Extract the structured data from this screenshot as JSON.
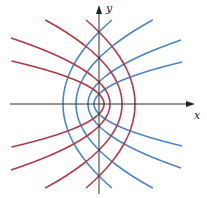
{
  "diagram": {
    "title": "",
    "axes": {
      "x_label": "x",
      "y_label": "y",
      "origin_px": [
        99,
        104
      ],
      "x_range_px": [
        10,
        195
      ],
      "y_range_px": [
        5,
        194
      ],
      "color": "#333333"
    },
    "clip": {
      "x_min": -89,
      "x_max": 85,
      "y_max": 84
    },
    "families": [
      {
        "name": "right-opening",
        "color": "#4a86c8",
        "equation": "y^2 = 4a(x + a)",
        "params": [
          5,
          11,
          23,
          36
        ]
      },
      {
        "name": "left-opening",
        "color": "#b03a48",
        "equation": "y^2 = -4a(x - a)",
        "params": [
          5,
          11,
          23,
          36
        ]
      }
    ]
  }
}
